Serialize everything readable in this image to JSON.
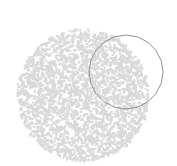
{
  "canvas": {
    "width": 177,
    "height": 166,
    "background": "#ffffff"
  },
  "speckled_disk": {
    "cx": 82,
    "cy": 94,
    "r": 66,
    "speckle_color": "#d9d9d9",
    "speckle_count": 2600,
    "speckle_size": 2,
    "density": 0.5
  },
  "outline_circle": {
    "cx": 126,
    "cy": 72,
    "r": 37,
    "stroke": "#8f8f8f",
    "stroke_width": 1,
    "sides": 20
  }
}
